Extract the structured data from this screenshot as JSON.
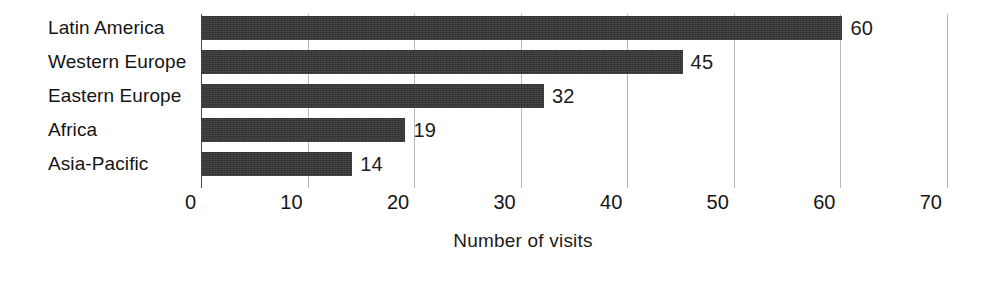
{
  "chart_data": {
    "type": "bar",
    "orientation": "horizontal",
    "title": "",
    "xlabel": "Number of visits",
    "ylabel": "",
    "categories": [
      "Latin America",
      "Western Europe",
      "Eastern Europe",
      "Africa",
      "Asia-Pacific"
    ],
    "values": [
      60,
      45,
      32,
      19,
      14
    ],
    "value_labels": [
      "60",
      "45",
      "32",
      "19",
      "14"
    ],
    "xlim": [
      0,
      70
    ],
    "xticks": [
      0,
      10,
      20,
      30,
      40,
      50,
      60,
      70
    ],
    "xtick_labels": [
      "0",
      "10",
      "20",
      "30",
      "40",
      "50",
      "60",
      "70"
    ],
    "grid": true,
    "grid_axis": "x",
    "legend": false,
    "bar_color": "#343434",
    "grid_color": "#b9b9b9",
    "axis_color": "#4a4a4a",
    "text_color": "#141414",
    "background": "#ffffff"
  }
}
